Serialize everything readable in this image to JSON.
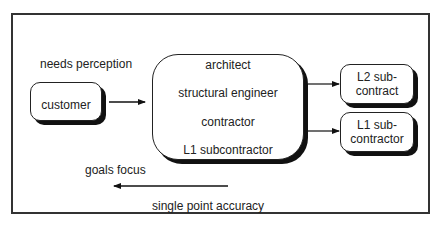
{
  "diagram": {
    "labels": {
      "needs_perception": "needs perception",
      "goals_focus": "goals focus",
      "single_point_accuracy": "single point accuracy"
    },
    "nodes": {
      "customer": "customer",
      "team": {
        "items": [
          "architect",
          "structural engineer",
          "contractor",
          "L1 subcontractor"
        ]
      },
      "l2_subcontract": {
        "line1": "L2 sub-",
        "line2": "contract"
      },
      "l1_subcontractor": {
        "line1": "L1 sub-",
        "line2": "contractor"
      }
    },
    "edges": [
      {
        "from": "customer",
        "to": "team"
      },
      {
        "from": "team",
        "to": "l2_subcontract"
      },
      {
        "from": "team",
        "to": "l1_subcontractor"
      },
      {
        "from": "right",
        "to": "left",
        "label": "goals focus"
      }
    ]
  }
}
